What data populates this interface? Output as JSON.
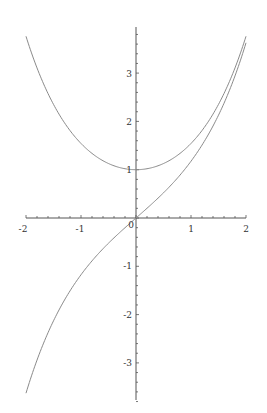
{
  "chart_data": {
    "type": "line",
    "title": "",
    "xlabel": "",
    "ylabel": "",
    "xlim": [
      -2,
      2
    ],
    "ylim": [
      -3.76,
      3.76
    ],
    "grid": false,
    "legend": null,
    "x": [
      -2,
      -1.75,
      -1.5,
      -1.25,
      -1,
      -0.75,
      -0.5,
      -0.25,
      0,
      0.25,
      0.5,
      0.75,
      1,
      1.25,
      1.5,
      1.75,
      2
    ],
    "series": [
      {
        "name": "cosh(x)",
        "values": [
          3.762,
          2.964,
          2.352,
          1.888,
          1.543,
          1.295,
          1.128,
          1.031,
          1.0,
          1.031,
          1.128,
          1.295,
          1.543,
          1.888,
          2.352,
          2.964,
          3.762
        ]
      },
      {
        "name": "sinh(x)",
        "values": [
          -3.627,
          -2.79,
          -2.129,
          -1.602,
          -1.175,
          -0.822,
          -0.521,
          -0.253,
          0.0,
          0.253,
          0.521,
          0.822,
          1.175,
          1.602,
          2.129,
          2.79,
          3.627
        ]
      }
    ],
    "x_ticks": [
      "-2",
      "-1",
      "0",
      "1",
      "2"
    ],
    "y_ticks": [
      "-3",
      "-2",
      "-1",
      "1",
      "2",
      "3"
    ]
  },
  "axis_labels": {
    "x_m2": "-2",
    "x_m1": "-1",
    "origin": "0",
    "x_1": "1",
    "x_2": "2",
    "y_3": "3",
    "y_2": "2",
    "y_1": "1",
    "y_m1": "-1",
    "y_m2": "-2",
    "y_m3": "-3"
  },
  "colors": {
    "curve": "#8a8a8a",
    "axis": "#555555"
  }
}
